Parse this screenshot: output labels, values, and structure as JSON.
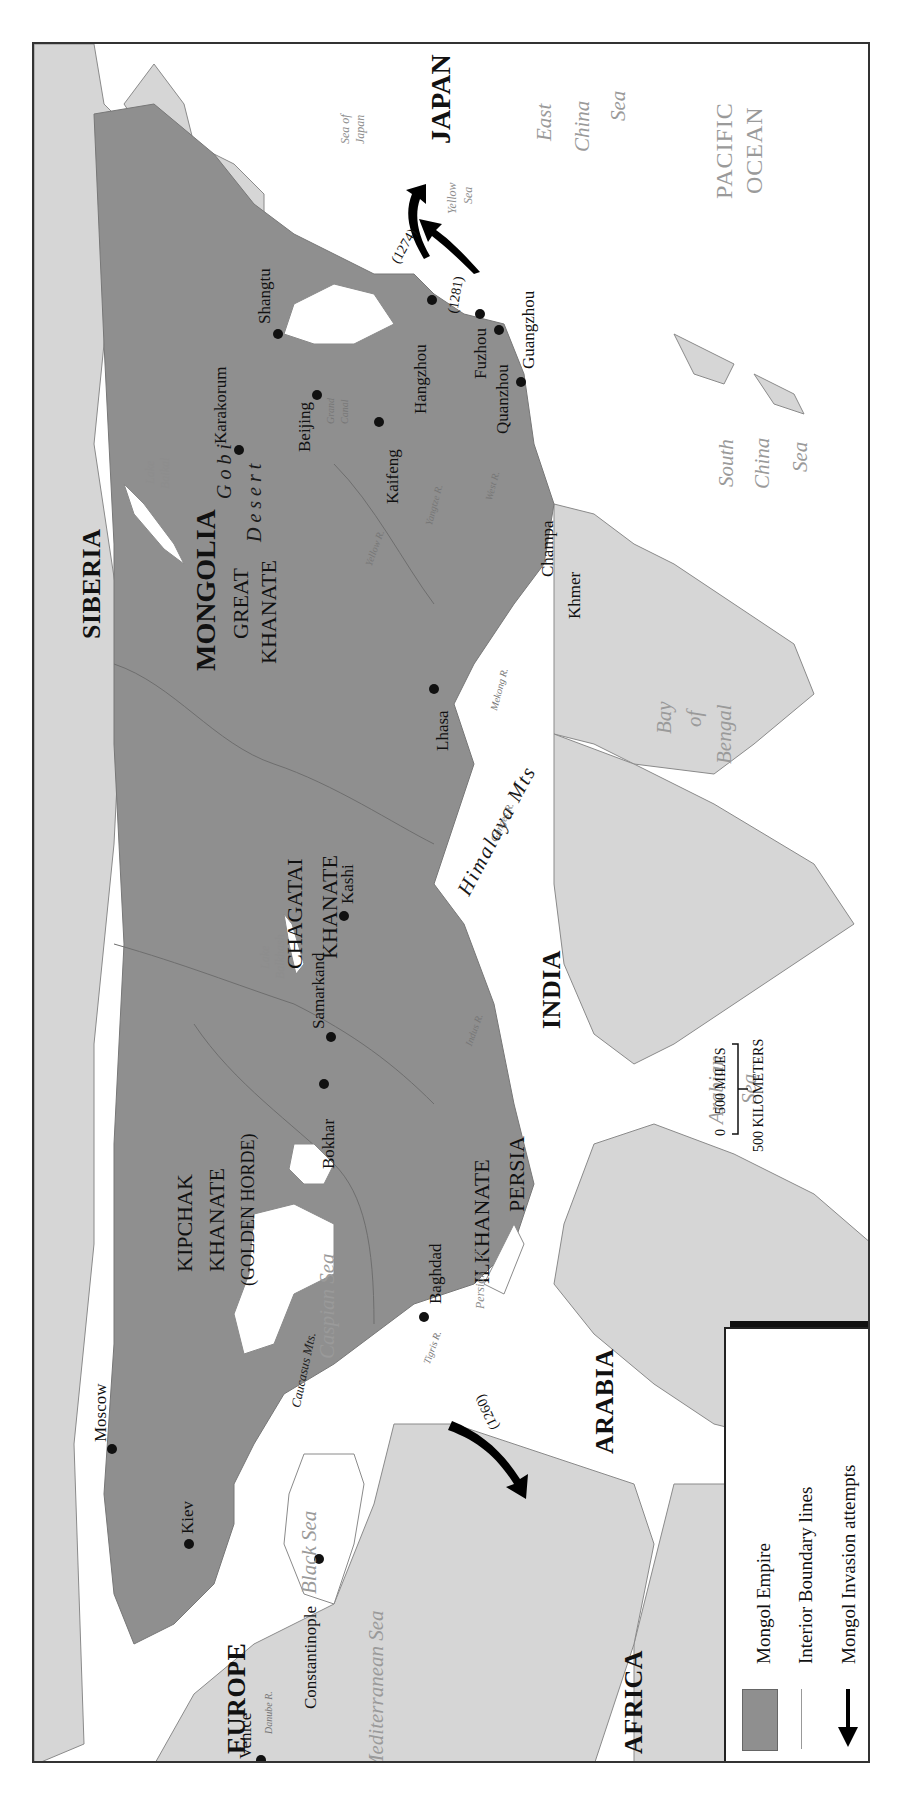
{
  "map": {
    "title": "Mongol Empire",
    "orientation": "rotated 90° counter-clockwise",
    "colors": {
      "empire_fill": "#8f8f8f",
      "land_fill": "#d4d4d4",
      "water": "#ffffff",
      "boundary_line": "#6e6e6e",
      "label_text": "#111111",
      "water_label_text": "#9a9a9a"
    },
    "regions": {
      "japan": "JAPAN",
      "siberia": "SIBERIA",
      "mongolia": "MONGOLIA",
      "great_khanate_1": "GREAT",
      "great_khanate_2": "KHANATE",
      "chagatai_1": "CHAGATAI",
      "chagatai_2": "KHANATE",
      "kipchak_1": "KIPCHAK",
      "kipchak_2": "KHANATE",
      "kipchak_3": "(GOLDEN HORDE)",
      "ilkhanate": "ILKHANATE",
      "persia": "PERSIA",
      "india": "INDIA",
      "arabia": "ARABIA",
      "europe": "EUROPE",
      "africa": "AFRICA",
      "champa": "Champa",
      "khmer": "Khmer"
    },
    "cities": [
      {
        "name": "Karakorum"
      },
      {
        "name": "Shangtu"
      },
      {
        "name": "Beijing"
      },
      {
        "name": "Kaifeng"
      },
      {
        "name": "Hangzhou"
      },
      {
        "name": "Fuzhou"
      },
      {
        "name": "Quanzhou"
      },
      {
        "name": "Guangzhou"
      },
      {
        "name": "Lhasa"
      },
      {
        "name": "Kashi"
      },
      {
        "name": "Samarkand"
      },
      {
        "name": "Bokhar"
      },
      {
        "name": "Baghdad"
      },
      {
        "name": "Moscow"
      },
      {
        "name": "Kiev"
      },
      {
        "name": "Constantinople"
      },
      {
        "name": "Venice"
      }
    ],
    "water": {
      "sea_of_japan_1": "Sea of",
      "sea_of_japan_2": "Japan",
      "pacific_1": "PACIFIC",
      "pacific_2": "OCEAN",
      "east_china_1": "East",
      "east_china_2": "China",
      "east_china_3": "Sea",
      "yellow_1": "Yellow",
      "yellow_2": "Sea",
      "south_china_1": "South",
      "south_china_2": "China",
      "south_china_3": "Sea",
      "bay_bengal_1": "Bay",
      "bay_bengal_2": "of",
      "bay_bengal_3": "Bengal",
      "arabian_1": "Arabian",
      "arabian_2": "Sea",
      "caspian": "Caspian Sea",
      "black": "Black Sea",
      "mediterranean": "Mediterranean Sea",
      "persian_gulf": "Persian Gulf",
      "lake_baikal_1": "Lake",
      "lake_baikal_2": "Baikal",
      "lake_balkhash_1": "Lake",
      "lake_balkhash_2": "Balkhash"
    },
    "features": {
      "gobi_1": "Gobi",
      "gobi_2": "Desert",
      "himalaya": "Himalaya Mts",
      "caucasus": "Caucasus Mts.",
      "grand_canal_1": "Grand",
      "grand_canal_2": "Canal",
      "yellow_river": "Yellow R.",
      "yangtze": "Yangtze R.",
      "west_river": "West R.",
      "mekong": "Mekong R.",
      "ganges": "Ganges R.",
      "indus": "Indus R.",
      "tigris": "Tigris R.",
      "danube": "Danube R."
    },
    "invasions": [
      {
        "year": "(1274)",
        "target": "Japan"
      },
      {
        "year": "(1281)",
        "target": "Japan"
      },
      {
        "year": "(1260)",
        "target": "Egypt"
      }
    ]
  },
  "legend": {
    "items": [
      {
        "label": "Mongol Empire",
        "symbol": "gray-swatch"
      },
      {
        "label": "Interior Boundary lines",
        "symbol": "thin-line"
      },
      {
        "label": "Mongol Invasion attempts",
        "symbol": "black-arrow"
      }
    ]
  },
  "scale": {
    "zero": "0",
    "miles": "500 MILES",
    "kilometers": "500 KILOMETERS"
  }
}
